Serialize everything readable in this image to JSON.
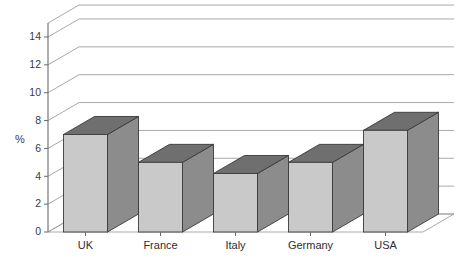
{
  "chart_data": {
    "type": "bar",
    "title": "",
    "subtitle": "",
    "xlabel": "",
    "ylabel": "%",
    "categories": [
      "UK",
      "France",
      "Italy",
      "Germany",
      "USA"
    ],
    "values": [
      7.0,
      5.0,
      4.2,
      5.0,
      7.3
    ],
    "series": [
      {
        "name": "%",
        "values": [
          7.0,
          5.0,
          4.2,
          5.0,
          7.3
        ]
      }
    ],
    "ylim": [
      0,
      15
    ],
    "ytick_labels": [
      "0",
      "2",
      "4",
      "6",
      "8",
      "10",
      "12",
      "14"
    ],
    "ytick_values": [
      0,
      2,
      4,
      6,
      8,
      10,
      12,
      14
    ],
    "grid": true,
    "grid_axis": "y",
    "legend": false,
    "legend_position": "none",
    "projection": "3d-extruded-columns",
    "annotations": []
  },
  "style": {
    "bar_face_color": "#c9c9c9",
    "bar_side_color": "#8c8c8c",
    "bar_top_color": "#6f6f6f",
    "bar_outline_color": "#3a3a3a",
    "grid_color": "#9e9e9e",
    "axis_color": "#6b6b6b",
    "text_color": "#3a3a3a",
    "background_color": "#ffffff"
  }
}
